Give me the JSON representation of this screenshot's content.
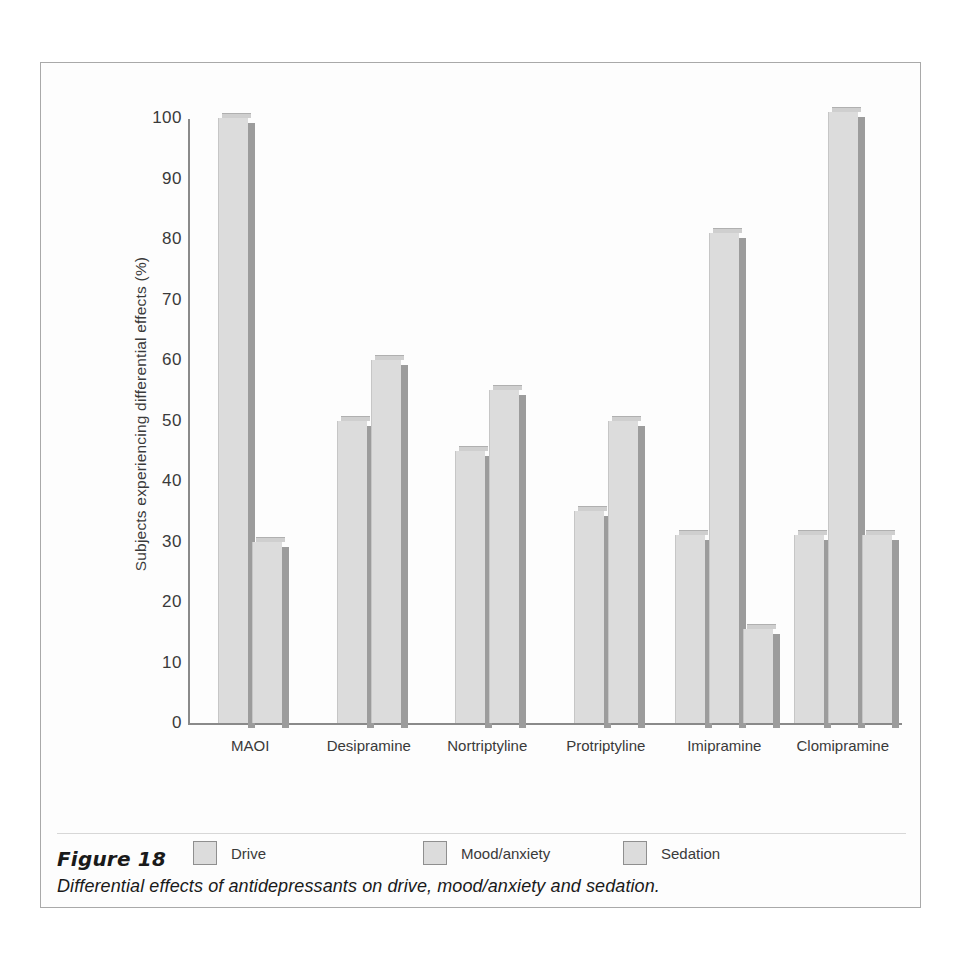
{
  "figure": {
    "caption_title": "Figure 18",
    "caption_text": "Differential effects of antidepressants on drive, mood/anxiety and sedation."
  },
  "chart_data": {
    "type": "bar",
    "title": "",
    "xlabel": "",
    "ylabel": "Subjects experiencing differential effects (%)",
    "ylim": [
      0,
      100
    ],
    "yticks": [
      0,
      10,
      20,
      30,
      40,
      50,
      60,
      70,
      80,
      90,
      100
    ],
    "grid": false,
    "legend_position": "bottom-left",
    "categories": [
      "MAOI",
      "Desipramine",
      "Nortriptyline",
      "Protriptyline",
      "Imipramine",
      "Clomipramine"
    ],
    "series": [
      {
        "name": "Drive",
        "values": [
          100,
          50,
          45,
          35,
          31,
          31
        ]
      },
      {
        "name": "Mood/anxiety",
        "values": [
          30,
          60,
          55,
          50,
          81,
          101
        ]
      },
      {
        "name": "Sedation",
        "values": [
          null,
          null,
          null,
          null,
          15.5,
          31
        ]
      }
    ],
    "colors": {
      "bar_fill": "#dcdcdc",
      "bar_side": "#9c9c9c",
      "bar_top": "#cfcfcf",
      "axis": "#8a8a8a",
      "text": "#3a3a3a",
      "frame": "#a9a9a9"
    }
  }
}
